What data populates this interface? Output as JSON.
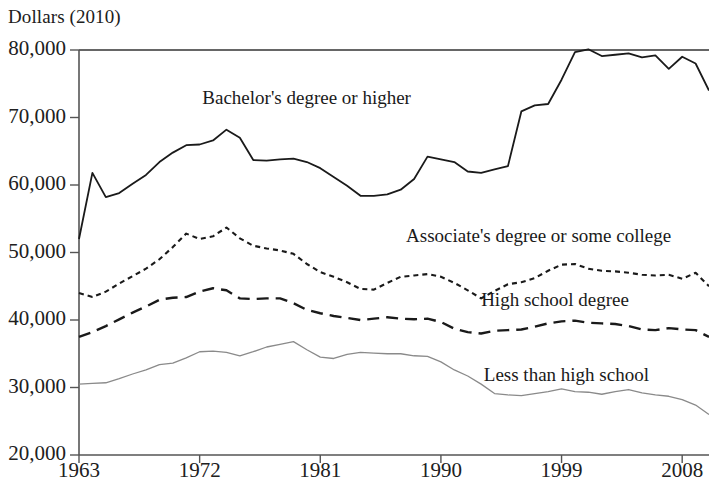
{
  "chart_data": {
    "type": "line",
    "title": "Dollars (2010)",
    "xlabel": "",
    "ylabel": "Dollars (2010)",
    "xlim": [
      1963,
      2010
    ],
    "ylim": [
      20000,
      80000
    ],
    "grid": false,
    "legend_position": "inline-annotations",
    "y_ticks": [
      "20,000",
      "30,000",
      "40,000",
      "50,000",
      "60,000",
      "70,000",
      "80,000"
    ],
    "y_tick_values": [
      20000,
      30000,
      40000,
      50000,
      60000,
      70000,
      80000
    ],
    "x_ticks": [
      "1963",
      "1972",
      "1981",
      "1990",
      "1999",
      "2008"
    ],
    "x_tick_values": [
      1963,
      1972,
      1981,
      1990,
      1999,
      2008
    ],
    "x": [
      1963,
      1964,
      1965,
      1966,
      1967,
      1968,
      1969,
      1970,
      1971,
      1972,
      1973,
      1974,
      1975,
      1976,
      1977,
      1978,
      1979,
      1980,
      1981,
      1982,
      1983,
      1984,
      1985,
      1986,
      1987,
      1988,
      1989,
      1990,
      1991,
      1992,
      1993,
      1994,
      1995,
      1996,
      1997,
      1998,
      1999,
      2000,
      2001,
      2002,
      2003,
      2004,
      2005,
      2006,
      2007,
      2008,
      2009,
      2010
    ],
    "series": [
      {
        "name": "Bachelor's degree or higher",
        "style": "solid",
        "color": "#1a1a1a",
        "width": 1.8,
        "label_x": 1972.2,
        "label_y": 72600,
        "values": [
          52000,
          61800,
          58200,
          58800,
          60200,
          61500,
          63400,
          64800,
          65900,
          66000,
          66600,
          68200,
          67000,
          63700,
          63600,
          63800,
          63900,
          63400,
          62500,
          61200,
          59900,
          58400,
          58400,
          58600,
          59300,
          60900,
          64200,
          63800,
          63400,
          62000,
          61800,
          62300,
          62800,
          70900,
          71800,
          72000,
          75600,
          79700,
          80100,
          79100,
          79300,
          79500,
          78900,
          79200,
          77200,
          79000,
          78000,
          74000
        ]
      },
      {
        "name": "Associate's degree or some college",
        "style": "dotted",
        "color": "#1a1a1a",
        "width": 2.1,
        "label_x": 1987.4,
        "label_y": 52200,
        "values": [
          44000,
          43400,
          44200,
          45400,
          46500,
          47600,
          49000,
          50800,
          52800,
          52000,
          52400,
          53700,
          52100,
          51000,
          50600,
          50300,
          49800,
          48300,
          47100,
          46400,
          45600,
          44600,
          44500,
          45500,
          46400,
          46600,
          46800,
          46400,
          45500,
          44400,
          43200,
          44300,
          45300,
          45600,
          46200,
          47300,
          48200,
          48300,
          47600,
          47300,
          47200,
          47000,
          46700,
          46600,
          46700,
          46100,
          47000,
          45000
        ]
      },
      {
        "name": "High school degree",
        "style": "dashed",
        "color": "#1a1a1a",
        "width": 2.4,
        "label_x": 1993.0,
        "label_y": 42700,
        "values": [
          37500,
          38200,
          39100,
          40100,
          41100,
          42000,
          43000,
          43300,
          43400,
          44200,
          44700,
          44400,
          43200,
          43100,
          43200,
          43200,
          42500,
          41500,
          41000,
          40600,
          40300,
          40000,
          40200,
          40400,
          40200,
          40100,
          40200,
          39700,
          38700,
          38200,
          38000,
          38400,
          38500,
          38600,
          39000,
          39500,
          39800,
          39900,
          39600,
          39500,
          39400,
          39100,
          38600,
          38500,
          38800,
          38600,
          38500,
          37500
        ]
      },
      {
        "name": "Less than high school",
        "style": "solid-thin",
        "color": "#8a8a8a",
        "width": 1.3,
        "label_x": 1993.2,
        "label_y": 31600,
        "values": [
          30500,
          30600,
          30700,
          31300,
          32000,
          32600,
          33400,
          33600,
          34400,
          35300,
          35400,
          35200,
          34700,
          35300,
          36000,
          36400,
          36800,
          35600,
          34500,
          34300,
          34900,
          35200,
          35100,
          35000,
          35000,
          34700,
          34600,
          33800,
          32600,
          31700,
          30500,
          29100,
          28900,
          28800,
          29100,
          29400,
          29800,
          29400,
          29300,
          29000,
          29400,
          29700,
          29200,
          28900,
          28700,
          28200,
          27400,
          26000
        ]
      }
    ]
  }
}
